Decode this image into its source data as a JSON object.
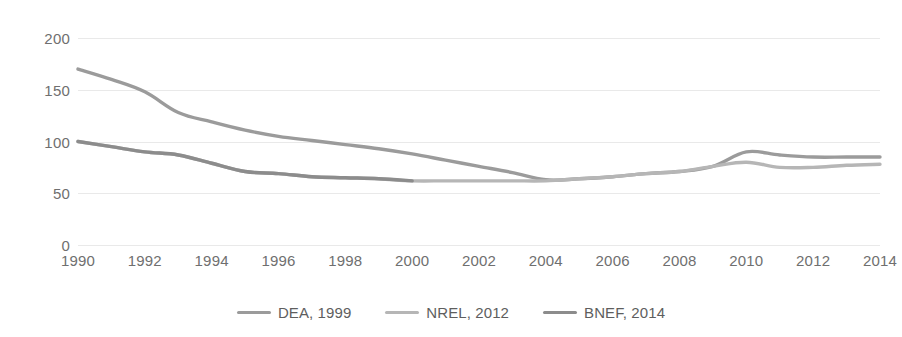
{
  "chart_data": {
    "type": "line",
    "title": "",
    "subtitle": "",
    "xlabel": "",
    "ylabel": "",
    "xlim": [
      1990,
      2014
    ],
    "ylim": [
      0,
      200
    ],
    "grid": true,
    "legend_position": "bottom",
    "y_ticks": [
      0,
      50,
      100,
      150,
      200
    ],
    "y_tick_labels": [
      "0",
      "50",
      "100",
      "150",
      "200"
    ],
    "x_ticks": [
      1990,
      1992,
      1994,
      1996,
      1998,
      2000,
      2002,
      2004,
      2006,
      2008,
      2010,
      2012,
      2014
    ],
    "x_tick_labels": [
      "1990",
      "1992",
      "1994",
      "1996",
      "1998",
      "2000",
      "2002",
      "2004",
      "2006",
      "2008",
      "2010",
      "2012",
      "2014"
    ],
    "series": [
      {
        "name": "DEA, 1999",
        "color": "#9b9b9b",
        "x": [
          1990,
          1991,
          1992,
          1993,
          1994,
          1995,
          1996,
          1997,
          1998,
          1999,
          2000,
          2001,
          2002,
          2003,
          2004,
          2005,
          2006,
          2007,
          2008,
          2009,
          2010,
          2011,
          2012,
          2013,
          2014
        ],
        "values": [
          170,
          160,
          148,
          128,
          119,
          111,
          105,
          101,
          97,
          93,
          88,
          82,
          76,
          70,
          63,
          64,
          66,
          69,
          71,
          76,
          90,
          87,
          85,
          85,
          85
        ]
      },
      {
        "name": "NREL, 2012",
        "color": "#b6b6b6",
        "x": [
          1990,
          1991,
          1992,
          1993,
          1994,
          1995,
          1996,
          1997,
          1998,
          1999,
          2000,
          2001,
          2002,
          2003,
          2004,
          2005,
          2006,
          2007,
          2008,
          2009,
          2010,
          2011,
          2012,
          2013,
          2014
        ],
        "values": [
          100,
          95,
          90,
          87,
          79,
          71,
          69,
          66,
          65,
          64,
          62,
          62,
          62,
          62,
          62,
          64,
          66,
          69,
          71,
          76,
          80,
          75,
          75,
          77,
          78
        ]
      },
      {
        "name": "BNEF, 2014",
        "color": "#8c8c8c",
        "x": [
          1990,
          1991,
          1992,
          1993,
          1994,
          1995,
          1996,
          1997,
          1998,
          1999,
          2000
        ],
        "values": [
          100,
          95,
          90,
          87,
          79,
          71,
          69,
          66,
          65,
          64,
          62
        ]
      }
    ]
  },
  "legend": {
    "items": [
      {
        "label": "DEA, 1999",
        "color": "#9b9b9b"
      },
      {
        "label": "NREL, 2012",
        "color": "#b6b6b6"
      },
      {
        "label": "BNEF, 2014",
        "color": "#8c8c8c"
      }
    ]
  }
}
